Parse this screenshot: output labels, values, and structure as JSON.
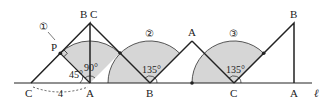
{
  "diagram": {
    "line_label": "ℓ",
    "colors": {
      "stroke": "#222222",
      "sector_fill": "#d6d6d6",
      "sector_stroke": "#555555",
      "background": "#ffffff"
    },
    "position1": {
      "top_label": "B C",
      "left_label": "C",
      "base_label": "A",
      "point_label": "P",
      "angle_label_45": "45°",
      "angle_label_90": "90°",
      "distance_label": "4",
      "sector_label": "①"
    },
    "position2": {
      "base_label": "B",
      "top_label": "A",
      "angle_label": "135°",
      "sector_label": "②"
    },
    "position3": {
      "base_label_left": "C",
      "base_label_right": "A",
      "top_label": "B",
      "angle_label": "135°",
      "sector_label": "③"
    }
  }
}
